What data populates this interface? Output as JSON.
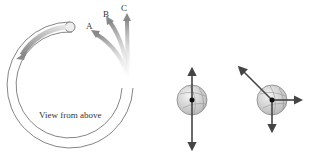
{
  "figure": {
    "caption_label": "View from above",
    "path_labels": [
      "A",
      "B",
      "C"
    ],
    "colors": {
      "tube_stroke": "#555555",
      "arrow_gray": "#8a8a8a",
      "force_arrow": "#444444",
      "ball_fill": "#d8d8d8"
    }
  },
  "panels": [
    {
      "name": "ball-vertical-forces",
      "forces": [
        "up",
        "down"
      ]
    },
    {
      "name": "ball-three-forces",
      "forces": [
        "up-left",
        "right",
        "down"
      ]
    }
  ]
}
